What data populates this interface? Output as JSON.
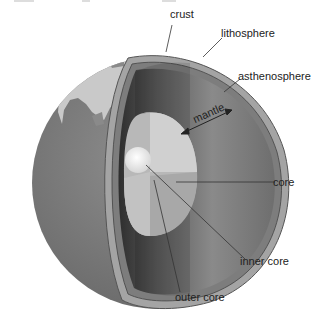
{
  "diagram": {
    "labels": {
      "crust": "crust",
      "lithosphere": "lithosphere",
      "asthenosphere": "asthenosphere",
      "mantle": "mantle",
      "core": "core",
      "inner_core": "inner core",
      "outer_core": "outer core"
    },
    "colors": {
      "background": "#ffffff",
      "ocean": "#7a7a7a",
      "land": "#c8c8c8",
      "crust_rim": "#9a9a9a",
      "mantle_dark": "#4a4a4a",
      "mantle_light": "#8c8c8c",
      "outer_core": "#c4c4c4",
      "inner_core": "#f4f4f4",
      "leader_line": "#333333",
      "text": "#222222"
    }
  }
}
